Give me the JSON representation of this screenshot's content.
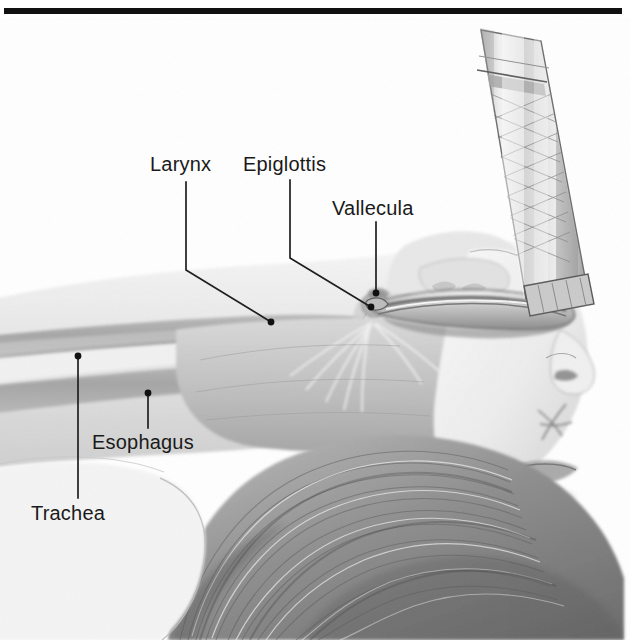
{
  "figure": {
    "kind": "medical-illustration",
    "style": "pencil / graphite sketch, greyscale",
    "width": 630,
    "height": 640,
    "background_color": "#ffffff",
    "rule_color": "#111111",
    "label_color": "#1a1a1a",
    "leader_color": "#1f1f1f",
    "airway_fill": "#a9a9a9",
    "tissue_light": "#efefef",
    "tissue_mid": "#d8d8d8",
    "tissue_dark": "#9a9a9a",
    "hair_dark": "#6f6f6f",
    "hair_light": "#cdcdcd"
  },
  "labels": [
    {
      "id": "larynx",
      "text": "Larynx",
      "x": 150,
      "y": 154
    },
    {
      "id": "epiglottis",
      "text": "Epiglottis",
      "x": 243,
      "y": 154
    },
    {
      "id": "vallecula",
      "text": "Vallecula",
      "x": 332,
      "y": 198
    },
    {
      "id": "esophagus",
      "text": "Esophagus",
      "x": 92,
      "y": 432
    },
    {
      "id": "trachea",
      "text": "Trachea",
      "x": 31,
      "y": 503
    }
  ],
  "leaders": [
    {
      "id": "larynx-leader",
      "points": "186,182 186,270 271,322",
      "dot": [
        271,
        322
      ]
    },
    {
      "id": "epiglottis-leader",
      "points": "290,180 290,258 371,307",
      "dot": [
        371,
        307
      ]
    },
    {
      "id": "vallecula-leader",
      "points": "376,222 376,293",
      "dot": [
        376,
        293
      ]
    },
    {
      "id": "esophagus-leader",
      "points": "148,393 148,428",
      "dot": [
        148,
        393
      ]
    },
    {
      "id": "trachea-leader",
      "points": "78,356 78,498",
      "dot": [
        78,
        356
      ]
    }
  ],
  "anatomy": [
    {
      "id": "trachea-band",
      "name": "Trachea",
      "description": "upper grey tubular band running left to right"
    },
    {
      "id": "esophagus-band",
      "name": "Esophagus",
      "description": "lower grey tubular band running left to right"
    },
    {
      "id": "tongue",
      "name": "Tongue",
      "description": "large shaded mass under the blade"
    },
    {
      "id": "epiglottis-flap",
      "name": "Epiglottis",
      "description": "small flap at the laryngeal inlet"
    },
    {
      "id": "vallecula-pocket",
      "name": "Vallecula",
      "description": "pocket between tongue base and epiglottis"
    },
    {
      "id": "hair",
      "name": "Hair",
      "description": "sketched hair filling lower right"
    },
    {
      "id": "face-profile",
      "name": "Face profile",
      "description": "nose, lips and chin at right"
    }
  ],
  "instrument": {
    "id": "laryngoscope",
    "name": "Laryngoscope",
    "handle": {
      "description": "knurled cylindrical handle, tilted, upper right",
      "tilt_degrees": 12
    },
    "blade": {
      "description": "curved Macintosh blade entering the mouth and lifting the tongue"
    }
  }
}
